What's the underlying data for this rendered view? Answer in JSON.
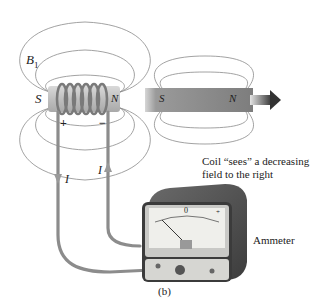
{
  "figure": {
    "label": "(b)",
    "field_label": "B",
    "field_subscript": "1",
    "coil": {
      "south_label": "S",
      "north_label": "N",
      "plus_label": "+",
      "minus_label": "−"
    },
    "magnet": {
      "south_label": "S",
      "north_label": "N",
      "motion": "right"
    },
    "current_left_label": "I",
    "current_right_label": "I",
    "caption_line1": "Coil “sees” a decreasing",
    "caption_line2": "field to the right",
    "meter_label": "Ammeter",
    "meter_zero": "0",
    "meter_plus": "+"
  },
  "colors": {
    "field_line": "#8a8a8a",
    "wire": "#8c8c8c",
    "coil_core": "#c8c8c8",
    "magnet": "#8e8e8e",
    "meter_case": "#5a5a5a",
    "meter_face": "#e8e8e4"
  }
}
